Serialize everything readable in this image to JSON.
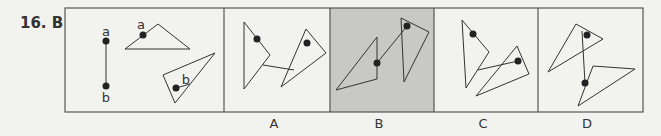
{
  "question": {
    "number": "16.",
    "answer": "B"
  },
  "stem": {
    "point_labels": [
      "a",
      "a",
      "b",
      "b"
    ]
  },
  "options": [
    {
      "label": "A",
      "selected": false
    },
    {
      "label": "B",
      "selected": true
    },
    {
      "label": "C",
      "selected": false
    },
    {
      "label": "D",
      "selected": false
    }
  ],
  "colors": {
    "background": "#f2f2ef",
    "border": "#555555",
    "highlight": "#c8c8c5",
    "dot": "#222222"
  }
}
